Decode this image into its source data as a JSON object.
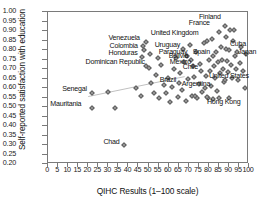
{
  "chart_data": {
    "type": "scatter",
    "title": "",
    "xlabel": "QIHC Results (1–100 scale)",
    "ylabel": "Self-reported satisfaction with education",
    "xlim": [
      0,
      100
    ],
    "ylim": [
      0.2,
      1.0
    ],
    "xticks": [
      "0",
      "5",
      "10",
      "15",
      "20",
      "25",
      "30",
      "35",
      "40",
      "45",
      "50",
      "55",
      "60",
      "65",
      "70",
      "75",
      "80",
      "85",
      "90",
      "95",
      "100"
    ],
    "yticks": [
      "1.00",
      "0.95",
      "0.90",
      "0.85",
      "0.80",
      "0.75",
      "0.70",
      "0.65",
      "0.60",
      "0.55",
      "0.50",
      "0.45",
      "0.40",
      "0.35",
      "0.30",
      "0.25",
      "0.20"
    ],
    "grid": false,
    "legend": false,
    "trendline": {
      "x0": 20,
      "y0": 0.555,
      "x1": 68,
      "y1": 0.66
    },
    "labeled_points": [
      {
        "label": "Finland",
        "x": 88.0,
        "y": 0.925,
        "lx": -26,
        "ly": -9
      },
      {
        "label": "France",
        "x": 85.0,
        "y": 0.895,
        "lx": -30,
        "ly": -9
      },
      {
        "label": "Cuba",
        "x": 88.5,
        "y": 0.805,
        "lx": 4,
        "ly": -5
      },
      {
        "label": "United Kingdom",
        "x": 79.0,
        "y": 0.845,
        "lx": -56,
        "ly": -8
      },
      {
        "label": "Venezuela",
        "x": 49.0,
        "y": 0.84,
        "lx": -38,
        "ly": -4
      },
      {
        "label": "Colombia",
        "x": 48.0,
        "y": 0.8,
        "lx": -35,
        "ly": -4
      },
      {
        "label": "Honduras",
        "x": 47.0,
        "y": 0.765,
        "lx": -34,
        "ly": -4
      },
      {
        "label": "Dominican Republic",
        "x": 49.0,
        "y": 0.715,
        "lx": -61,
        "ly": -4
      },
      {
        "label": "Uruguay",
        "x": 67.0,
        "y": 0.805,
        "lx": -28,
        "ly": -4
      },
      {
        "label": "Paraguay",
        "x": 69.0,
        "y": 0.77,
        "lx": -28,
        "ly": -4
      },
      {
        "label": "Bolivia",
        "x": 71.0,
        "y": 0.75,
        "lx": -22,
        "ly": -4
      },
      {
        "label": "Mexico",
        "x": 72.0,
        "y": 0.715,
        "lx": -23,
        "ly": -4
      },
      {
        "label": "Chile",
        "x": 76.0,
        "y": 0.69,
        "lx": -18,
        "ly": -4
      },
      {
        "label": "Spain",
        "x": 82.0,
        "y": 0.77,
        "lx": -20,
        "ly": -4
      },
      {
        "label": "Japan",
        "x": 93.0,
        "y": 0.77,
        "lx": 3,
        "ly": -4
      },
      {
        "label": "United States",
        "x": 88.0,
        "y": 0.64,
        "lx": -16,
        "ly": -4
      },
      {
        "label": "Argentina",
        "x": 78.0,
        "y": 0.6,
        "lx": -23,
        "ly": -4
      },
      {
        "label": "Brazil",
        "x": 65.0,
        "y": 0.625,
        "lx": -19,
        "ly": -3
      },
      {
        "label": "Hong Kong",
        "x": 90.0,
        "y": 0.545,
        "lx": -22,
        "ly": 4
      },
      {
        "label": "Senegal",
        "x": 22.0,
        "y": 0.575,
        "lx": -30,
        "ly": -4
      },
      {
        "label": "Mauritania",
        "x": 22.0,
        "y": 0.495,
        "lx": -42,
        "ly": -4
      },
      {
        "label": "Chad",
        "x": 38.0,
        "y": 0.3,
        "lx": -21,
        "ly": -3
      }
    ],
    "unlabeled_points": [
      {
        "x": 30.0,
        "y": 0.58
      },
      {
        "x": 33.5,
        "y": 0.495
      },
      {
        "x": 44.0,
        "y": 0.6
      },
      {
        "x": 46.5,
        "y": 0.56
      },
      {
        "x": 51.0,
        "y": 0.625
      },
      {
        "x": 52.5,
        "y": 0.575
      },
      {
        "x": 53.5,
        "y": 0.67
      },
      {
        "x": 55.0,
        "y": 0.545
      },
      {
        "x": 56.0,
        "y": 0.72
      },
      {
        "x": 57.5,
        "y": 0.615
      },
      {
        "x": 58.5,
        "y": 0.575
      },
      {
        "x": 59.5,
        "y": 0.655
      },
      {
        "x": 60.5,
        "y": 0.525
      },
      {
        "x": 61.5,
        "y": 0.605
      },
      {
        "x": 62.5,
        "y": 0.7
      },
      {
        "x": 63.5,
        "y": 0.76
      },
      {
        "x": 64.5,
        "y": 0.555
      },
      {
        "x": 65.5,
        "y": 0.68
      },
      {
        "x": 66.5,
        "y": 0.59
      },
      {
        "x": 67.5,
        "y": 0.735
      },
      {
        "x": 68.5,
        "y": 0.53
      },
      {
        "x": 69.5,
        "y": 0.645
      },
      {
        "x": 70.5,
        "y": 0.825
      },
      {
        "x": 71.5,
        "y": 0.56
      },
      {
        "x": 72.5,
        "y": 0.66
      },
      {
        "x": 73.5,
        "y": 0.79
      },
      {
        "x": 74.0,
        "y": 0.545
      },
      {
        "x": 75.0,
        "y": 0.62
      },
      {
        "x": 75.5,
        "y": 0.725
      },
      {
        "x": 76.5,
        "y": 0.58
      },
      {
        "x": 77.5,
        "y": 0.835
      },
      {
        "x": 78.5,
        "y": 0.665
      },
      {
        "x": 79.5,
        "y": 0.545
      },
      {
        "x": 80.0,
        "y": 0.75
      },
      {
        "x": 80.5,
        "y": 0.69
      },
      {
        "x": 81.0,
        "y": 0.61
      },
      {
        "x": 81.5,
        "y": 0.86
      },
      {
        "x": 82.5,
        "y": 0.715
      },
      {
        "x": 83.0,
        "y": 0.655
      },
      {
        "x": 83.5,
        "y": 0.79
      },
      {
        "x": 84.0,
        "y": 0.585
      },
      {
        "x": 84.5,
        "y": 0.735
      },
      {
        "x": 85.5,
        "y": 0.68
      },
      {
        "x": 86.0,
        "y": 0.815
      },
      {
        "x": 86.5,
        "y": 0.75
      },
      {
        "x": 87.0,
        "y": 0.7
      },
      {
        "x": 87.5,
        "y": 0.63
      },
      {
        "x": 88.5,
        "y": 0.87
      },
      {
        "x": 89.0,
        "y": 0.74
      },
      {
        "x": 89.5,
        "y": 0.685
      },
      {
        "x": 90.0,
        "y": 0.8
      },
      {
        "x": 90.5,
        "y": 0.905
      },
      {
        "x": 91.0,
        "y": 0.72
      },
      {
        "x": 91.5,
        "y": 0.655
      },
      {
        "x": 92.0,
        "y": 0.845
      },
      {
        "x": 92.5,
        "y": 0.905
      },
      {
        "x": 93.5,
        "y": 0.7
      },
      {
        "x": 94.0,
        "y": 0.79
      },
      {
        "x": 94.5,
        "y": 0.64
      },
      {
        "x": 95.5,
        "y": 0.73
      },
      {
        "x": 96.0,
        "y": 0.815
      },
      {
        "x": 97.0,
        "y": 0.69
      },
      {
        "x": 98.0,
        "y": 0.6
      },
      {
        "x": 98.5,
        "y": 0.78
      },
      {
        "x": 85.0,
        "y": 0.545
      },
      {
        "x": 82.0,
        "y": 0.54
      },
      {
        "x": 79.0,
        "y": 0.555
      },
      {
        "x": 73.0,
        "y": 0.56
      },
      {
        "x": 50.0,
        "y": 0.705
      },
      {
        "x": 54.5,
        "y": 0.76
      },
      {
        "x": 47.5,
        "y": 0.82
      },
      {
        "x": 50.5,
        "y": 0.78
      }
    ]
  }
}
